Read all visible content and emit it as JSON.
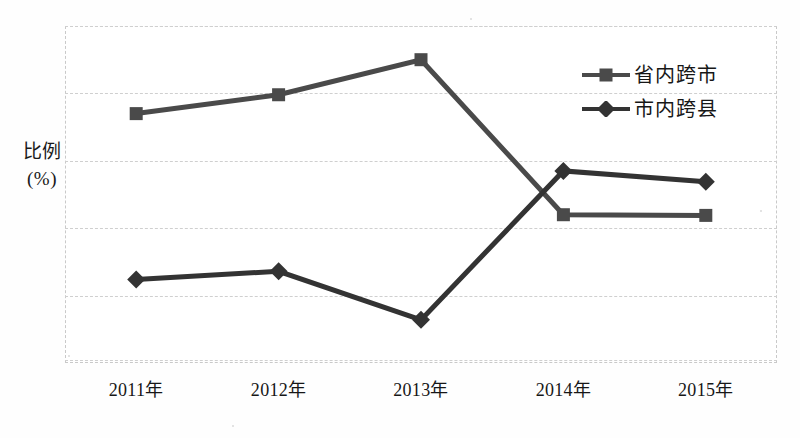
{
  "figure": {
    "y_axis_caption": "比\n例\n(%)",
    "background_color": "#ffffff",
    "frame_color": "#c9c9c9",
    "grid_color": "#cfcfcf"
  },
  "legend": {
    "position": "inside-top-right",
    "entries": [
      {
        "label": "省内跨市",
        "marker": "square",
        "color": "#4a4a4a"
      },
      {
        "label": "市内跨县",
        "marker": "diamond",
        "color": "#333333"
      }
    ]
  },
  "chart_data": {
    "type": "line",
    "title": "",
    "subtitle": "",
    "xlabel": "",
    "ylabel": "比例(%)",
    "categories": [
      "2011年",
      "2012年",
      "2013年",
      "2014年",
      "2015年"
    ],
    "ylim": [
      0,
      50
    ],
    "yticks": [
      0,
      10,
      20,
      30,
      40,
      50
    ],
    "ytick_labels": [
      "",
      "",
      "",
      "",
      "",
      ""
    ],
    "grid": true,
    "grid_axis": "y",
    "legend_position": "inside-top-right",
    "series": [
      {
        "name": "省内跨市",
        "marker": "square",
        "color": "#4a4a4a",
        "values": [
          37.0,
          39.8,
          45.0,
          22.0,
          21.9
        ]
      },
      {
        "name": "市内跨县",
        "marker": "diamond",
        "color": "#333333",
        "values": [
          12.4,
          13.6,
          6.4,
          28.5,
          26.9
        ]
      }
    ],
    "annotations": []
  }
}
